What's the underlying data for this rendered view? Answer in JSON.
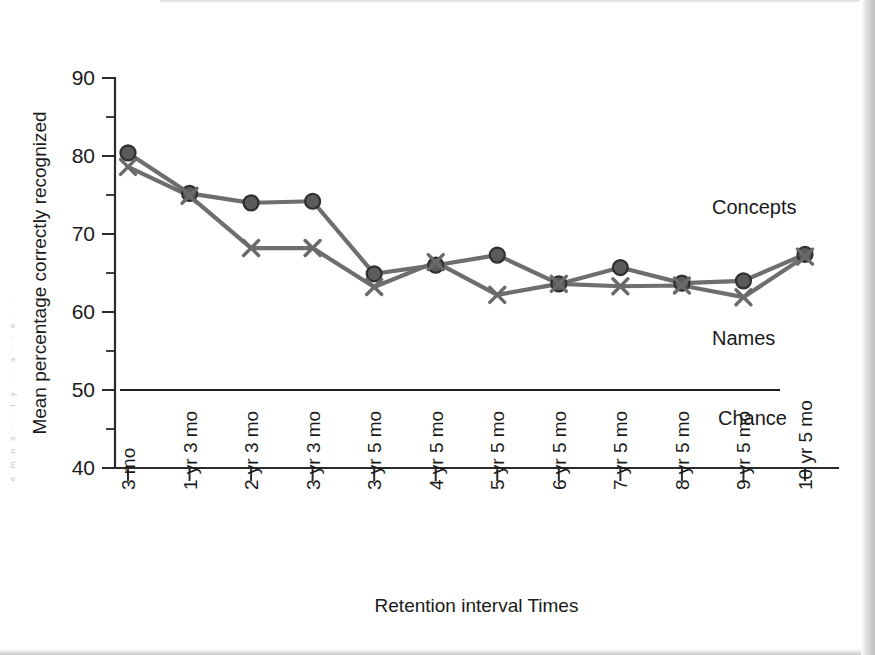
{
  "figure": {
    "background": "#ffffff",
    "line_color": "#6e6e6e",
    "marker_fill": "#5b5b5b",
    "axis_color": "#2b2b2b"
  },
  "scan": {
    "left_column_fragment": "e m n o · · l y · · a · · e · ·"
  },
  "chart_data": {
    "type": "line",
    "title": "",
    "xlabel": "Retention interval Times",
    "ylabel": "Mean percentage correctly recognized",
    "ylim": [
      40,
      90
    ],
    "ytick_labels": [
      "40",
      "50",
      "60",
      "70",
      "80",
      "90"
    ],
    "ytick_values": [
      40,
      50,
      60,
      70,
      80,
      90
    ],
    "yminor_values": [
      45,
      55,
      65,
      75,
      85
    ],
    "grid": false,
    "legend_position": "inline-right",
    "categories": [
      "3 mo",
      "1 yr 3 mo",
      "2 yr 3 mo",
      "3 yr 3 mo",
      "3 yr 5 mo",
      "4 yr 5 mo",
      "5 yr 5 mo",
      "6 yr 5 mo",
      "7 yr 5 mo",
      "8 yr 5 mo",
      "9 yr 5 mo",
      "10 yr 5 mo"
    ],
    "series": [
      {
        "name": "Concepts",
        "marker": "circle",
        "values": [
          80.4,
          75.2,
          74.0,
          74.2,
          64.9,
          66.0,
          67.3,
          63.6,
          65.7,
          63.7,
          64.0,
          67.4
        ]
      },
      {
        "name": "Names",
        "marker": "x",
        "values": [
          78.6,
          74.9,
          68.2,
          68.2,
          63.2,
          66.4,
          62.2,
          63.6,
          63.3,
          63.4,
          61.9,
          67.1
        ]
      }
    ],
    "reference_lines": [
      {
        "label": "Chance",
        "value": 50
      }
    ]
  }
}
